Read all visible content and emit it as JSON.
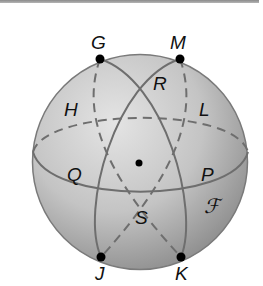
{
  "figure": {
    "type": "sphere-great-circles",
    "points": [
      {
        "id": "G",
        "label": "G",
        "x": 100,
        "y": 59
      },
      {
        "id": "M",
        "label": "M",
        "x": 180,
        "y": 59
      },
      {
        "id": "J",
        "label": "J",
        "x": 101,
        "y": 257
      },
      {
        "id": "K",
        "label": "K",
        "x": 181,
        "y": 257
      },
      {
        "id": "center",
        "label": "",
        "x": 139,
        "y": 163
      }
    ],
    "region_labels": [
      {
        "id": "H",
        "label": "H"
      },
      {
        "id": "R",
        "label": "R"
      },
      {
        "id": "L",
        "label": "L"
      },
      {
        "id": "Q",
        "label": "Q"
      },
      {
        "id": "P",
        "label": "P"
      },
      {
        "id": "S",
        "label": "S"
      },
      {
        "id": "F",
        "label": "ℱ"
      }
    ],
    "colors": {
      "sphere_light": "#d8d8d8",
      "sphere_dark": "#8c8c8c",
      "line": "#6e6e6e",
      "point": "#000000"
    }
  }
}
